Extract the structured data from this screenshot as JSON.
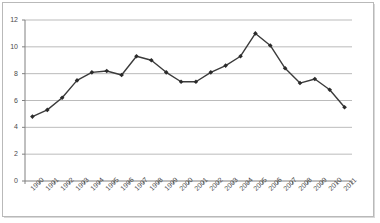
{
  "chart_data": {
    "type": "line",
    "title": "",
    "subtitle": "",
    "xlabel": "",
    "ylabel": "",
    "categories": [
      "1990",
      "1991",
      "1992",
      "1993",
      "1994",
      "1995",
      "1996",
      "1997",
      "1998",
      "1999",
      "2000",
      "2001",
      "2002",
      "2003",
      "2004",
      "2005",
      "2006",
      "2007",
      "2008",
      "2009",
      "2010",
      "2011"
    ],
    "values": [
      4.8,
      5.3,
      6.2,
      7.5,
      8.1,
      8.2,
      7.9,
      9.3,
      9.0,
      8.1,
      7.4,
      7.4,
      8.1,
      8.6,
      9.3,
      11.0,
      10.1,
      8.4,
      7.3,
      7.6,
      6.8,
      5.5
    ],
    "series": [
      {
        "name": "",
        "values": [
          4.8,
          5.3,
          6.2,
          7.5,
          8.1,
          8.2,
          7.9,
          9.3,
          9.0,
          8.1,
          7.4,
          7.4,
          8.1,
          8.6,
          9.3,
          11.0,
          10.1,
          8.4,
          7.3,
          7.6,
          6.8,
          5.5
        ]
      }
    ],
    "ylim": [
      0,
      12
    ],
    "yticks": [
      0,
      2,
      4,
      6,
      8,
      10,
      12
    ],
    "ytick_labels": [
      "0",
      "2",
      "4",
      "6",
      "8",
      "10",
      "12"
    ],
    "grid": "horizontal",
    "legend": "none",
    "line_color": "#3b3b3b",
    "marker": "diamond",
    "marker_color": "#2b2b2b",
    "gridline_color": "#a9a9a9",
    "axis_color": "#808080",
    "plot_background": "#ffffff",
    "annotations": []
  }
}
